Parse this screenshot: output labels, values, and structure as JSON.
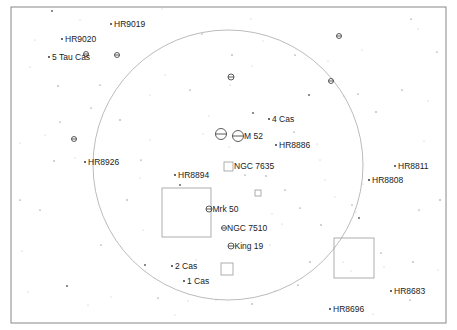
{
  "chart": {
    "frame": {
      "x": 11,
      "y": 7,
      "w": 435,
      "h": 316,
      "color": "#888888"
    },
    "field_circle": {
      "cx": 228,
      "cy": 165,
      "r": 135,
      "color": "#aaaaaa"
    },
    "fov_rects": [
      {
        "name": "fov-large-left",
        "x": 162,
        "y": 188,
        "w": 49,
        "h": 49
      },
      {
        "name": "fov-large-right",
        "x": 334,
        "y": 238,
        "w": 40,
        "h": 40
      },
      {
        "name": "fov-small-ngc7635",
        "x": 224,
        "y": 162,
        "w": 9,
        "h": 9
      },
      {
        "name": "fov-tiny",
        "x": 255,
        "y": 190,
        "w": 6,
        "h": 6
      },
      {
        "name": "fov-small-bottom",
        "x": 221,
        "y": 263,
        "w": 12,
        "h": 12
      }
    ],
    "labeled_stars": [
      {
        "label": "HR9019",
        "x": 111,
        "y": 24
      },
      {
        "label": "HR9020",
        "x": 62,
        "y": 39
      },
      {
        "label": "5 Tau Cas",
        "x": 49,
        "y": 57
      },
      {
        "label": "4 Cas",
        "x": 269,
        "y": 119
      },
      {
        "label": "HR8886",
        "x": 276,
        "y": 145
      },
      {
        "label": "HR8926",
        "x": 85,
        "y": 162
      },
      {
        "label": "HR8894",
        "x": 175,
        "y": 175
      },
      {
        "label": "HR8811",
        "x": 395,
        "y": 166
      },
      {
        "label": "HR8808",
        "x": 369,
        "y": 180
      },
      {
        "label": "2 Cas",
        "x": 172,
        "y": 266
      },
      {
        "label": "1 Cas",
        "x": 184,
        "y": 281
      },
      {
        "label": "HR8683",
        "x": 391,
        "y": 291
      },
      {
        "label": "HR8696",
        "x": 330,
        "y": 309
      }
    ],
    "clusters": [
      {
        "label": "M 52",
        "x": 238,
        "y": 136,
        "r": 5.5
      },
      {
        "label": "",
        "x": 221,
        "y": 134,
        "r": 5.5
      },
      {
        "label": "Mrk 50",
        "x": 209,
        "y": 209,
        "r": 3
      },
      {
        "label": "NGC 7510",
        "x": 224,
        "y": 228,
        "r": 2.5
      },
      {
        "label": "King 19",
        "x": 231,
        "y": 246,
        "r": 3
      },
      {
        "label": "",
        "x": 86,
        "y": 54,
        "r": 2.5
      },
      {
        "label": "",
        "x": 117,
        "y": 55,
        "r": 2.5
      },
      {
        "label": "",
        "x": 74,
        "y": 139,
        "r": 2.5
      },
      {
        "label": "",
        "x": 231,
        "y": 77,
        "r": 3
      },
      {
        "label": "",
        "x": 331,
        "y": 81,
        "r": 2.5
      },
      {
        "label": "",
        "x": 339,
        "y": 36,
        "r": 2.5
      }
    ],
    "nebulae": [
      {
        "label": "NGC 7635",
        "x": 228,
        "y": 166
      }
    ],
    "field_stars": [
      [
        52,
        11
      ],
      [
        162,
        9
      ],
      [
        251,
        19
      ],
      [
        411,
        19
      ],
      [
        30,
        67
      ],
      [
        58,
        86
      ],
      [
        91,
        108
      ],
      [
        20,
        143
      ],
      [
        45,
        135
      ],
      [
        60,
        122
      ],
      [
        54,
        161
      ],
      [
        75,
        158
      ],
      [
        40,
        210
      ],
      [
        22,
        251
      ],
      [
        28,
        292
      ],
      [
        67,
        286
      ],
      [
        88,
        305
      ],
      [
        111,
        297
      ],
      [
        101,
        245
      ],
      [
        143,
        230
      ],
      [
        127,
        200
      ],
      [
        141,
        160
      ],
      [
        150,
        140
      ],
      [
        165,
        75
      ],
      [
        202,
        34
      ],
      [
        232,
        55
      ],
      [
        252,
        66
      ],
      [
        295,
        55
      ],
      [
        230,
        85
      ],
      [
        263,
        41
      ],
      [
        253,
        113
      ],
      [
        203,
        134
      ],
      [
        209,
        116
      ],
      [
        245,
        175
      ],
      [
        229,
        147
      ],
      [
        266,
        176
      ],
      [
        285,
        190
      ],
      [
        282,
        224
      ],
      [
        272,
        214
      ],
      [
        300,
        208
      ],
      [
        321,
        225
      ],
      [
        335,
        197
      ],
      [
        352,
        205
      ],
      [
        356,
        212
      ],
      [
        363,
        184
      ],
      [
        359,
        218
      ],
      [
        343,
        262
      ],
      [
        351,
        271
      ],
      [
        381,
        253
      ],
      [
        384,
        267
      ],
      [
        413,
        262
      ],
      [
        419,
        210
      ],
      [
        424,
        141
      ],
      [
        428,
        101
      ],
      [
        437,
        52
      ],
      [
        376,
        112
      ],
      [
        344,
        96
      ],
      [
        358,
        94
      ],
      [
        328,
        61
      ],
      [
        362,
        50
      ],
      [
        309,
        95
      ],
      [
        317,
        144
      ],
      [
        320,
        160
      ],
      [
        294,
        132
      ],
      [
        275,
        291
      ],
      [
        252,
        304
      ],
      [
        158,
        298
      ],
      [
        175,
        315
      ],
      [
        188,
        301
      ],
      [
        298,
        285
      ],
      [
        310,
        262
      ],
      [
        373,
        314
      ],
      [
        402,
        90
      ],
      [
        418,
        29
      ],
      [
        140,
        178
      ],
      [
        180,
        185
      ],
      [
        196,
        260
      ],
      [
        216,
        300
      ],
      [
        190,
        90
      ],
      [
        150,
        95
      ],
      [
        120,
        120
      ],
      [
        100,
        85
      ],
      [
        270,
        245
      ],
      [
        325,
        180
      ],
      [
        410,
        300
      ],
      [
        440,
        200
      ],
      [
        438,
        270
      ],
      [
        20,
        200
      ],
      [
        35,
        40
      ],
      [
        80,
        20
      ],
      [
        145,
        265
      ]
    ]
  }
}
